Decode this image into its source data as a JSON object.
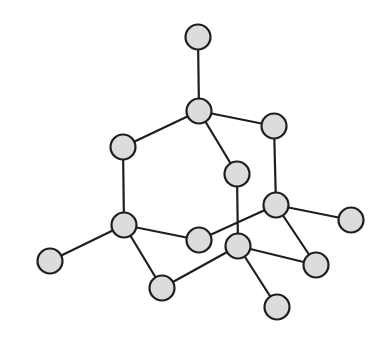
{
  "diagram": {
    "type": "ball-and-stick molecular structure",
    "atom_radius": 12.5,
    "colors": {
      "atom_fill": "#dcdcdc",
      "stroke": "#1e1e1e",
      "background": "#ffffff"
    },
    "atoms": [
      {
        "id": "a1",
        "x": 198,
        "y": 37
      },
      {
        "id": "a2",
        "x": 199,
        "y": 111
      },
      {
        "id": "a3",
        "x": 274,
        "y": 126
      },
      {
        "id": "a4",
        "x": 123,
        "y": 147
      },
      {
        "id": "a5",
        "x": 237,
        "y": 174
      },
      {
        "id": "a6",
        "x": 276,
        "y": 205
      },
      {
        "id": "a7",
        "x": 351,
        "y": 220
      },
      {
        "id": "a8",
        "x": 124,
        "y": 225
      },
      {
        "id": "a9",
        "x": 199,
        "y": 240
      },
      {
        "id": "a10",
        "x": 238,
        "y": 246
      },
      {
        "id": "a11",
        "x": 50,
        "y": 261
      },
      {
        "id": "a12",
        "x": 316,
        "y": 265
      },
      {
        "id": "a13",
        "x": 162,
        "y": 288
      },
      {
        "id": "a14",
        "x": 277,
        "y": 307
      }
    ],
    "bonds": [
      [
        "a1",
        "a2"
      ],
      [
        "a2",
        "a3"
      ],
      [
        "a2",
        "a4"
      ],
      [
        "a2",
        "a5"
      ],
      [
        "a3",
        "a6"
      ],
      [
        "a4",
        "a8"
      ],
      [
        "a5",
        "a10"
      ],
      [
        "a6",
        "a9"
      ],
      [
        "a6",
        "a7"
      ],
      [
        "a6",
        "a12"
      ],
      [
        "a8",
        "a9"
      ],
      [
        "a8",
        "a11"
      ],
      [
        "a8",
        "a13"
      ],
      [
        "a10",
        "a13"
      ],
      [
        "a10",
        "a12"
      ],
      [
        "a10",
        "a14"
      ]
    ]
  }
}
